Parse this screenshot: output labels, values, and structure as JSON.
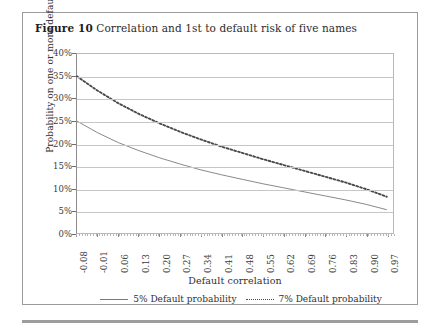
{
  "figure": {
    "label": "Figure 10",
    "title": "Correlation and 1st to default risk of five names"
  },
  "chart_data": {
    "type": "line",
    "title": "Correlation and 1st to default risk of five names",
    "xlabel": "Default correlation",
    "ylabel": "Probability on one or more defaults",
    "xlim": [
      -0.08,
      1.0
    ],
    "ylim": [
      0,
      0.4
    ],
    "ytick_labels": [
      "40%",
      "35%",
      "30%",
      "25%",
      "20%",
      "15%",
      "10%",
      "5%",
      "0%"
    ],
    "ytick_values": [
      40,
      35,
      30,
      25,
      20,
      15,
      10,
      5,
      0
    ],
    "xtick_labels": [
      "-0.08",
      "-0.01",
      "0.06",
      "0.13",
      "0.20",
      "0.27",
      "0.34",
      "0.41",
      "0.48",
      "0.55",
      "0.62",
      "0.69",
      "0.76",
      "0.83",
      "0.90",
      "0.97"
    ],
    "xtick_values": [
      -0.08,
      -0.01,
      0.06,
      0.13,
      0.2,
      0.27,
      0.34,
      0.41,
      0.48,
      0.55,
      0.62,
      0.69,
      0.76,
      0.83,
      0.9,
      0.97
    ],
    "grid": "horizontal",
    "legend_position": "bottom-center",
    "x": [
      -0.08,
      -0.01,
      0.06,
      0.13,
      0.2,
      0.27,
      0.34,
      0.41,
      0.48,
      0.55,
      0.62,
      0.69,
      0.76,
      0.83,
      0.9,
      0.97
    ],
    "series": [
      {
        "name": "5% Default probability",
        "style": "solid",
        "color": "#7a7a7a",
        "values": [
          25.0,
          22.4,
          20.2,
          18.4,
          16.8,
          15.4,
          14.1,
          13.0,
          12.0,
          11.0,
          10.1,
          9.2,
          8.3,
          7.4,
          6.4,
          5.2
        ]
      },
      {
        "name": "7% Default probability",
        "style": "dotted",
        "color": "#4a4a4a",
        "values": [
          35.0,
          31.8,
          29.0,
          26.6,
          24.5,
          22.6,
          20.9,
          19.3,
          17.9,
          16.5,
          15.2,
          13.9,
          12.6,
          11.3,
          9.8,
          8.1
        ]
      }
    ]
  },
  "legend": {
    "entries": [
      {
        "label": "5% Default probability"
      },
      {
        "label": "7% Default probability"
      }
    ]
  }
}
